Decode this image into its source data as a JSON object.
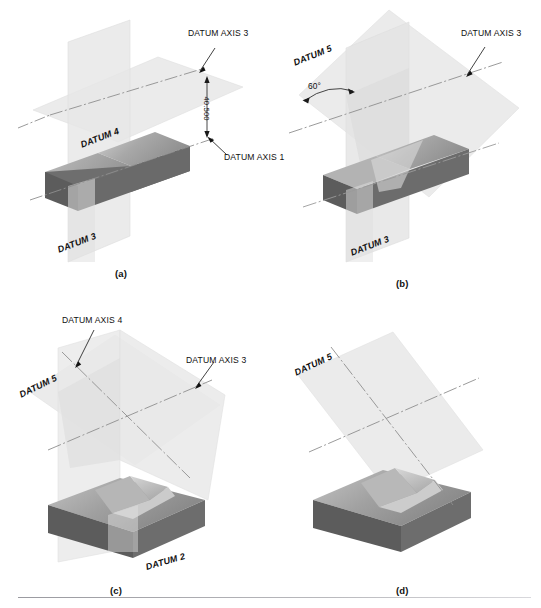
{
  "figure": {
    "panels": [
      {
        "id": "a",
        "label": "(a)",
        "callouts": [
          {
            "name": "datum-axis-3",
            "text": "DATUM AXIS 3"
          },
          {
            "name": "datum-axis-1",
            "text": "DATUM AXIS 1"
          }
        ],
        "plane_labels": [
          {
            "name": "datum-4",
            "text": "DATUM 4"
          },
          {
            "name": "datum-3",
            "text": "DATUM 3"
          }
        ],
        "dimensions": [
          {
            "name": "vertical-offset",
            "text": "40.500"
          }
        ]
      },
      {
        "id": "b",
        "label": "(b)",
        "callouts": [
          {
            "name": "datum-axis-3",
            "text": "DATUM AXIS 3"
          }
        ],
        "plane_labels": [
          {
            "name": "datum-5",
            "text": "DATUM 5"
          },
          {
            "name": "datum-3",
            "text": "DATUM 3"
          }
        ],
        "dimensions": [
          {
            "name": "angle",
            "text": "60°"
          }
        ]
      },
      {
        "id": "c",
        "label": "(c)",
        "callouts": [
          {
            "name": "datum-axis-4",
            "text": "DATUM AXIS 4"
          },
          {
            "name": "datum-axis-3",
            "text": "DATUM AXIS 3"
          }
        ],
        "plane_labels": [
          {
            "name": "datum-5",
            "text": "DATUM 5"
          },
          {
            "name": "datum-2",
            "text": "DATUM 2"
          }
        ],
        "dimensions": []
      },
      {
        "id": "d",
        "label": "(d)",
        "callouts": [],
        "plane_labels": [
          {
            "name": "datum-5",
            "text": "DATUM 5"
          }
        ],
        "dimensions": []
      }
    ],
    "colors": {
      "plane_fill": "#ebebeb",
      "plane_fill_overlap": "#dcdcdc",
      "block_top_light": "#c9c9c9",
      "block_top_dark": "#8f8f8f",
      "block_front": "#6e6e6e",
      "block_side": "#5c5c5c",
      "axis_line": "#8a8a8a",
      "leader_line": "#1a1a1a",
      "rule": "#a8a8ae",
      "text": "#101010"
    }
  }
}
